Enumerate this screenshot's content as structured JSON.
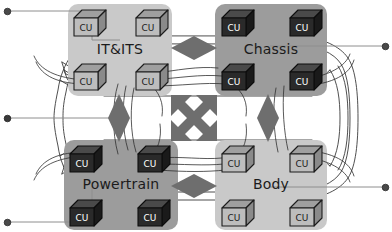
{
  "diagram": {
    "background": {
      "name": "vehicle-top-view-outline",
      "stroke": "#3b3b3b",
      "fill": "#ffffff"
    },
    "colors": {
      "panel_light": "#c9c9c9",
      "panel_mid": "#9c9c9c",
      "cu_light_face": "#bdbdbd",
      "cu_dark_face": "#2a2a2a",
      "cu_outline": "#1c1c1c",
      "connector_gray": "#6e6e6e",
      "wire_stroke": "#2f2f2f",
      "dot_fill": "#4a4a4a",
      "label_text": "#1b1b1b"
    },
    "domains": [
      {
        "id": "it-its",
        "label": "IT&ITS",
        "panel_shade": "light",
        "cu_shade": "light",
        "x": 68,
        "y": 4,
        "w": 104,
        "h": 92,
        "label_x": 120,
        "label_y": 50,
        "cu_count": 4,
        "cu_label": "CU"
      },
      {
        "id": "chassis",
        "label": "Chassis",
        "panel_shade": "mid",
        "cu_shade": "dark",
        "x": 215,
        "y": 4,
        "w": 112,
        "h": 92,
        "label_x": 271,
        "label_y": 50,
        "cu_count": 4,
        "cu_label": "CU"
      },
      {
        "id": "powertrain",
        "label": "Powertrain",
        "panel_shade": "mid",
        "cu_shade": "dark",
        "x": 64,
        "y": 140,
        "w": 114,
        "h": 90,
        "label_x": 121,
        "label_y": 185,
        "cu_count": 4,
        "cu_label": "CU"
      },
      {
        "id": "body",
        "label": "Body",
        "panel_shade": "light",
        "cu_shade": "light",
        "x": 215,
        "y": 140,
        "w": 112,
        "h": 90,
        "label_x": 271,
        "label_y": 185,
        "cu_count": 4,
        "cu_label": "CU"
      }
    ],
    "connectors": [
      {
        "id": "link-it-chassis",
        "shape": "diamond-horizontal",
        "cx": 194,
        "cy": 48,
        "rx": 23,
        "ry": 12
      },
      {
        "id": "link-powertrain-body",
        "shape": "diamond-horizontal",
        "cx": 194,
        "cy": 186,
        "rx": 23,
        "ry": 12
      },
      {
        "id": "link-it-powertrain",
        "shape": "diamond-vertical",
        "cx": 119,
        "cy": 118,
        "rx": 11,
        "ry": 24
      },
      {
        "id": "link-chassis-body",
        "shape": "diamond-vertical",
        "cx": 268,
        "cy": 118,
        "rx": 11,
        "ry": 24
      },
      {
        "id": "cross-domain-gateway",
        "shape": "four-way-arrow",
        "cx": 194,
        "cy": 118,
        "r": 30
      }
    ],
    "endpoints": [
      {
        "id": "endpoint-left-top",
        "side": "left",
        "x": 7,
        "y": 11
      },
      {
        "id": "endpoint-left-middle",
        "side": "left",
        "x": 7,
        "y": 118
      },
      {
        "id": "endpoint-left-bottom",
        "side": "left",
        "x": 7,
        "y": 222
      },
      {
        "id": "endpoint-right-top",
        "side": "right",
        "x": 385,
        "y": 46
      },
      {
        "id": "endpoint-right-bottom",
        "side": "right",
        "x": 385,
        "y": 187
      }
    ],
    "cu_nodes_per_domain": [
      {
        "dx": 0.1,
        "dy": 0.06
      },
      {
        "dx": 0.62,
        "dy": 0.06
      },
      {
        "dx": 0.1,
        "dy": 0.6
      },
      {
        "dx": 0.62,
        "dy": 0.6
      }
    ]
  }
}
